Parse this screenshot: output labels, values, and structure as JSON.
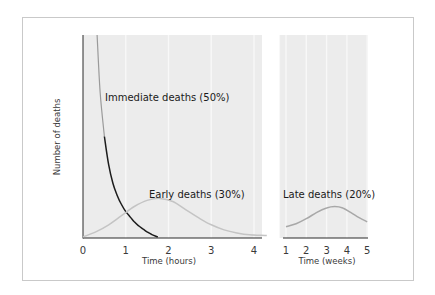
{
  "chart_data": {
    "type": "line",
    "title": "",
    "ylabel": "Number of deaths",
    "panels": [
      {
        "id": "hours",
        "xlabel": "Time (hours)",
        "xlim": [
          0,
          4.3
        ],
        "xticks": [
          0,
          1,
          2,
          3,
          4
        ],
        "tick_labels": [
          "0",
          "1",
          "2",
          "3",
          "4"
        ]
      },
      {
        "id": "weeks",
        "xlabel": "Time (weeks)",
        "xlim": [
          1,
          5
        ],
        "xticks": [
          1,
          2,
          3,
          4,
          5
        ],
        "tick_labels": [
          "1",
          "2",
          "3",
          "4",
          "5"
        ]
      }
    ],
    "ylim": [
      0,
      100
    ],
    "grid": "vertical",
    "series": [
      {
        "name": "Immediate deaths (50%)",
        "panel": "hours",
        "color_top": "#9a9a9a",
        "color": "#1c1c1c",
        "x": [
          0.33,
          0.4,
          0.5,
          0.6,
          0.7,
          0.8,
          0.9,
          1.0,
          1.1,
          1.2,
          1.3,
          1.4,
          1.5,
          1.6,
          1.75
        ],
        "y": [
          100,
          72,
          50,
          36,
          27,
          21,
          16.5,
          13,
          10.5,
          8,
          6,
          4.5,
          3,
          1.8,
          0.5
        ]
      },
      {
        "name": "Early deaths (30%)",
        "panel": "hours",
        "color": "#c4c4c4",
        "x": [
          0,
          0.3,
          0.6,
          0.9,
          1.2,
          1.5,
          1.8,
          2.1,
          2.4,
          2.7,
          3.0,
          3.3,
          3.6,
          3.9,
          4.3
        ],
        "y": [
          0.5,
          3,
          6.5,
          11,
          15.5,
          18.5,
          19.5,
          18,
          14,
          10,
          6.5,
          4,
          2.5,
          1.6,
          1.2
        ]
      },
      {
        "name": "Late deaths (20%)",
        "panel": "weeks",
        "color": "#a8a8a8",
        "x": [
          1,
          1.5,
          2,
          2.5,
          3,
          3.4,
          3.8,
          4.2,
          4.6,
          5
        ],
        "y": [
          5.5,
          7,
          9.5,
          12.5,
          14.8,
          15.5,
          14.8,
          12.5,
          10,
          8
        ]
      }
    ],
    "annotations": [
      {
        "text": "Immediate deaths (50%)"
      },
      {
        "text": "Early deaths (30%)"
      },
      {
        "text": "Late deaths (20%)"
      }
    ],
    "colors": {
      "plot_bg": "#ececec",
      "grid": "#f8f8f8",
      "axis": "#2a2a2a",
      "frame": "#c9c9c9"
    }
  }
}
